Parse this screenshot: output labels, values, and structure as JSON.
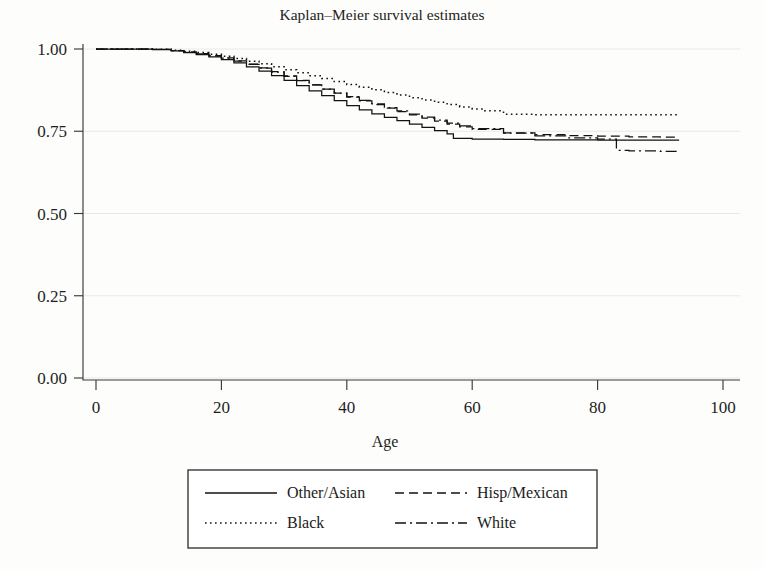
{
  "chart_data": {
    "type": "line",
    "title": "Kaplan–Meier survival estimates",
    "xlabel": "Age",
    "ylabel": "",
    "xlim": [
      0,
      100
    ],
    "ylim": [
      0.0,
      1.0
    ],
    "xticks": [
      "0",
      "20",
      "40",
      "60",
      "80",
      "100"
    ],
    "xtick_values": [
      0,
      20,
      40,
      60,
      80,
      100
    ],
    "yticks": [
      "0.00",
      "0.25",
      "0.50",
      "0.75",
      "1.00"
    ],
    "ytick_values": [
      0.0,
      0.25,
      0.5,
      0.75,
      1.0
    ],
    "grid": true,
    "grid_axis": "y",
    "legend_position": "below-axes",
    "series": [
      {
        "name": "Other/Asian",
        "linestyle": "solid",
        "color": "#121212",
        "x": [
          0,
          5,
          9,
          12,
          14,
          16,
          18,
          20,
          22,
          24,
          26,
          28,
          30,
          32,
          34,
          36,
          38,
          40,
          42,
          44,
          46,
          48,
          50,
          52,
          54,
          56,
          57,
          60,
          65,
          70,
          75,
          80,
          85,
          90,
          93
        ],
        "y": [
          1.0,
          1.0,
          0.998,
          0.994,
          0.989,
          0.983,
          0.976,
          0.968,
          0.958,
          0.946,
          0.933,
          0.919,
          0.905,
          0.889,
          0.873,
          0.858,
          0.843,
          0.828,
          0.815,
          0.803,
          0.792,
          0.782,
          0.772,
          0.762,
          0.752,
          0.742,
          0.728,
          0.726,
          0.725,
          0.724,
          0.724,
          0.723,
          0.723,
          0.723,
          0.723
        ]
      },
      {
        "name": "Hisp/Mexican",
        "linestyle": "dashed",
        "color": "#121212",
        "x": [
          0,
          5,
          9,
          12,
          14,
          16,
          18,
          20,
          22,
          24,
          26,
          28,
          30,
          32,
          34,
          36,
          38,
          40,
          42,
          44,
          46,
          48,
          50,
          52,
          54,
          56,
          58,
          60,
          65,
          70,
          75,
          80,
          85,
          90,
          93
        ],
        "y": [
          1.0,
          1.0,
          0.999,
          0.995,
          0.991,
          0.986,
          0.98,
          0.973,
          0.964,
          0.954,
          0.943,
          0.931,
          0.918,
          0.905,
          0.891,
          0.878,
          0.866,
          0.854,
          0.842,
          0.831,
          0.82,
          0.81,
          0.8,
          0.79,
          0.781,
          0.772,
          0.763,
          0.756,
          0.745,
          0.74,
          0.737,
          0.735,
          0.733,
          0.732,
          0.732
        ]
      },
      {
        "name": "Black",
        "linestyle": "dotted",
        "color": "#121212",
        "x": [
          0,
          5,
          9,
          12,
          14,
          16,
          18,
          20,
          22,
          24,
          26,
          28,
          30,
          32,
          34,
          36,
          38,
          40,
          42,
          44,
          46,
          48,
          50,
          52,
          54,
          56,
          58,
          60,
          62,
          65,
          70,
          75,
          80,
          85,
          90,
          93
        ],
        "y": [
          1.0,
          1.0,
          0.999,
          0.996,
          0.993,
          0.989,
          0.984,
          0.978,
          0.971,
          0.963,
          0.955,
          0.946,
          0.937,
          0.928,
          0.919,
          0.91,
          0.901,
          0.892,
          0.884,
          0.876,
          0.868,
          0.86,
          0.852,
          0.845,
          0.838,
          0.831,
          0.824,
          0.818,
          0.812,
          0.802,
          0.8,
          0.8,
          0.8,
          0.8,
          0.8,
          0.8
        ]
      },
      {
        "name": "White",
        "linestyle": "dashdot",
        "color": "#121212",
        "x": [
          0,
          5,
          9,
          12,
          14,
          16,
          18,
          20,
          22,
          24,
          26,
          28,
          30,
          32,
          34,
          36,
          38,
          40,
          42,
          44,
          46,
          48,
          50,
          52,
          54,
          56,
          58,
          60,
          65,
          70,
          75,
          80,
          83,
          85,
          90,
          93
        ],
        "y": [
          1.0,
          1.0,
          0.999,
          0.995,
          0.99,
          0.985,
          0.979,
          0.972,
          0.963,
          0.953,
          0.942,
          0.93,
          0.917,
          0.904,
          0.891,
          0.878,
          0.866,
          0.855,
          0.844,
          0.833,
          0.822,
          0.812,
          0.802,
          0.793,
          0.784,
          0.775,
          0.766,
          0.758,
          0.744,
          0.736,
          0.73,
          0.726,
          0.692,
          0.69,
          0.689,
          0.689
        ]
      }
    ]
  },
  "legend": {
    "entries": [
      {
        "label": "Other/Asian",
        "style": "solid"
      },
      {
        "label": "Hisp/Mexican",
        "style": "dashed"
      },
      {
        "label": "Black",
        "style": "dotted"
      },
      {
        "label": "White",
        "style": "dashdot"
      }
    ]
  }
}
